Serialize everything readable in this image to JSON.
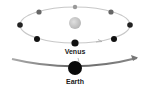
{
  "diagram": {
    "labels": {
      "venus": "Venus",
      "earth": "Earth"
    },
    "colors": {
      "orbit": "#c8c8c8",
      "sun": "#c4c4c4",
      "planet_dark": "#111111",
      "planet_gray": "#777777",
      "arrow": "#888888"
    }
  }
}
